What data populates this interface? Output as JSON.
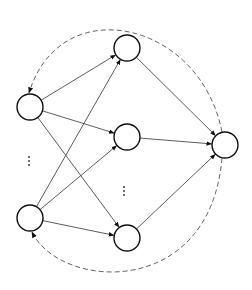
{
  "diagram": {
    "type": "neural-network",
    "colors": {
      "stroke": "#111111",
      "edge": "#333333",
      "dashed": "#555555",
      "background": "#ffffff"
    },
    "nodes": [
      {
        "id": "input-top",
        "layer": "input",
        "cx": 30,
        "cy": 107,
        "r": 13
      },
      {
        "id": "input-bottom",
        "layer": "input",
        "cx": 30,
        "cy": 218,
        "r": 13
      },
      {
        "id": "hidden-top",
        "layer": "hidden",
        "cx": 127,
        "cy": 48,
        "r": 13
      },
      {
        "id": "hidden-middle",
        "layer": "hidden",
        "cx": 127,
        "cy": 137,
        "r": 13
      },
      {
        "id": "hidden-bottom",
        "layer": "hidden",
        "cx": 127,
        "cy": 238,
        "r": 13
      },
      {
        "id": "output",
        "layer": "output",
        "cx": 225,
        "cy": 145,
        "r": 13
      }
    ],
    "edges": [
      {
        "from": "input-top",
        "to": "hidden-top"
      },
      {
        "from": "input-top",
        "to": "hidden-middle"
      },
      {
        "from": "input-top",
        "to": "hidden-bottom"
      },
      {
        "from": "input-bottom",
        "to": "hidden-top"
      },
      {
        "from": "input-bottom",
        "to": "hidden-middle"
      },
      {
        "from": "input-bottom",
        "to": "hidden-bottom"
      },
      {
        "from": "hidden-top",
        "to": "output"
      },
      {
        "from": "hidden-middle",
        "to": "output"
      },
      {
        "from": "hidden-bottom",
        "to": "output"
      }
    ],
    "feedback_edges": [
      {
        "from": "output",
        "to": "input-top",
        "style": "dashed",
        "path": "M 222 132 C 200 20, 60 -10, 29 93"
      },
      {
        "from": "output",
        "to": "input-bottom",
        "style": "dashed",
        "path": "M 222 158 C 210 300, 60 290, 32 232"
      }
    ],
    "ellipses": [
      {
        "id": "input-ellipsis",
        "glyph": "⋮",
        "x": 29,
        "y": 161
      },
      {
        "id": "hidden-ellipsis",
        "glyph": "⋮",
        "x": 124,
        "y": 191
      }
    ]
  }
}
